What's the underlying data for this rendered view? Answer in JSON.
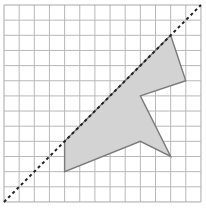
{
  "grid": {
    "cols": 13,
    "rows": 13,
    "origin_px": [
      4,
      5
    ],
    "cell_px": 15.15,
    "line_color": "#b8b8b8",
    "border_color": "#a8a8a8"
  },
  "shape": {
    "vertices_grid": [
      [
        11,
        2
      ],
      [
        12,
        5
      ],
      [
        9,
        6
      ],
      [
        11,
        10
      ],
      [
        9,
        9
      ],
      [
        4,
        11
      ],
      [
        4,
        9
      ]
    ],
    "fill": "#d3d3d3",
    "stroke": "#7a7a7a"
  },
  "mirror_line": {
    "from_grid": [
      0,
      13
    ],
    "to_grid": [
      13,
      0
    ],
    "style": "dashed",
    "color": "#222222"
  }
}
